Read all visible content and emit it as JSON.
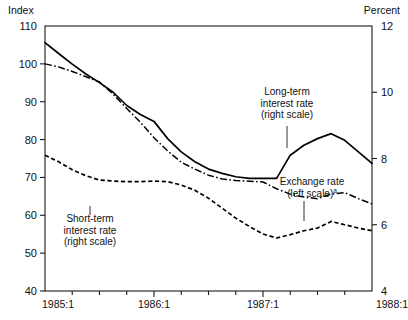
{
  "chart_data": {
    "type": "line",
    "title": "",
    "left_axis": {
      "label": "Index",
      "ticks": [
        110,
        100,
        90,
        80,
        70,
        60,
        50,
        40
      ],
      "ylim": [
        40,
        110
      ]
    },
    "right_axis": {
      "label": "Percent",
      "ticks": [
        12,
        10,
        8,
        6,
        4
      ],
      "ylim": [
        4,
        12
      ]
    },
    "xlabel": "",
    "x_tick_labels": [
      "1985:1",
      "1986:1",
      "1987:1",
      "1988:1"
    ],
    "x_major_positions": [
      0,
      4,
      8,
      12
    ],
    "x_minor_count": 13,
    "xlim": [
      0,
      12
    ],
    "grid": false,
    "legend_position": "inline-annotations",
    "series": [
      {
        "name": "Exchange rate (left scale)",
        "axis": "left",
        "style": "dash-dot",
        "x": [
          0,
          0.5,
          1,
          1.5,
          2,
          2.5,
          3,
          3.5,
          4,
          4.5,
          5,
          5.5,
          6,
          6.5,
          7,
          7.5,
          8,
          8.5,
          9,
          9.5,
          10,
          10.5,
          11,
          11.5,
          12
        ],
        "values": [
          100.0,
          99.2,
          98.0,
          96.6,
          95.2,
          92.0,
          88.2,
          84.6,
          80.5,
          77.0,
          74.0,
          72.2,
          70.6,
          69.6,
          69.2,
          69.0,
          68.8,
          67.0,
          65.6,
          64.8,
          64.4,
          65.6,
          66.0,
          64.4,
          63.0
        ]
      },
      {
        "name": "Long-term interest rate (right scale)",
        "axis": "right",
        "style": "solid",
        "x": [
          0,
          0.5,
          1,
          1.5,
          2,
          2.5,
          3,
          3.5,
          4,
          4.5,
          5,
          5.5,
          6,
          6.5,
          7,
          7.5,
          8,
          8.5,
          9,
          9.5,
          10,
          10.5,
          11,
          11.5,
          12
        ],
        "values": [
          11.5,
          11.17,
          10.85,
          10.55,
          10.29,
          10.0,
          9.6,
          9.33,
          9.12,
          8.6,
          8.2,
          7.9,
          7.68,
          7.55,
          7.45,
          7.4,
          7.4,
          7.4,
          8.1,
          8.4,
          8.6,
          8.75,
          8.55,
          8.2,
          7.85
        ]
      },
      {
        "name": "Short-term interest rate (right scale)",
        "axis": "right",
        "style": "dashed",
        "x": [
          0,
          0.5,
          1,
          1.5,
          2,
          2.5,
          3,
          3.5,
          4,
          4.5,
          5,
          5.5,
          6,
          6.5,
          7,
          7.5,
          8,
          8.5,
          9,
          9.5,
          10,
          10.5,
          11,
          11.5,
          12
        ],
        "values": [
          8.1,
          7.9,
          7.66,
          7.48,
          7.35,
          7.32,
          7.3,
          7.3,
          7.32,
          7.3,
          7.2,
          7.04,
          6.8,
          6.5,
          6.2,
          5.95,
          5.72,
          5.6,
          5.7,
          5.82,
          5.9,
          6.1,
          6.0,
          5.9,
          5.82
        ]
      }
    ],
    "annotations": [
      {
        "name": "long-term-annotation",
        "lines": [
          "Long-term",
          "interest rate",
          "(right scale)"
        ],
        "superscript": "",
        "text_x": 287,
        "text_y": 95,
        "leader": {
          "x1": 287,
          "y1": 126,
          "x2": 287,
          "y2": 148
        }
      },
      {
        "name": "exchange-rate-annotation",
        "lines": [
          "Exchange rate",
          "(left scale)"
        ],
        "superscript": "a",
        "text_x": 312,
        "text_y": 185,
        "leader": {
          "x1": 304,
          "y1": 201,
          "x2": 304,
          "y2": 221
        }
      },
      {
        "name": "short-term-annotation",
        "lines": [
          "Short-term",
          "interest rate",
          "(right scale)"
        ],
        "superscript": "",
        "text_x": 90,
        "text_y": 222,
        "leader": {
          "x1": 90,
          "y1": 206,
          "x2": 90,
          "y2": 215
        }
      }
    ]
  }
}
